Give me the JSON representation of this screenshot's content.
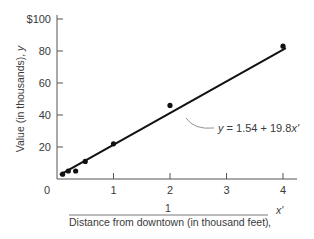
{
  "chart_data": {
    "type": "scatter",
    "title": "",
    "xlabel": "1 / Distance from downtown (in thousand feet), x'",
    "xlabel_numerator": "1",
    "xlabel_denominator": "Distance from downtown (in thousand feet)",
    "xlabel_var": "x'",
    "ylabel": "Value (in thousands), y",
    "ylabel_text": "Value (in thousands), ",
    "ylabel_var": "y",
    "xlim": [
      0,
      4.25
    ],
    "ylim": [
      0,
      100
    ],
    "x_ticks": [
      1,
      2,
      3,
      4
    ],
    "x_tick_labels": [
      "1",
      "2",
      "3",
      "4"
    ],
    "y_ticks": [
      20,
      40,
      60,
      80,
      100
    ],
    "y_tick_labels": [
      "20",
      "40",
      "60",
      "80",
      "$100"
    ],
    "origin_label": "0",
    "grid": false,
    "points": [
      {
        "x": 0.1,
        "y": 3
      },
      {
        "x": 0.2,
        "y": 5
      },
      {
        "x": 0.33,
        "y": 5
      },
      {
        "x": 0.5,
        "y": 11
      },
      {
        "x": 1.0,
        "y": 22
      },
      {
        "x": 2.0,
        "y": 46
      },
      {
        "x": 4.0,
        "y": 83
      }
    ],
    "fit_line": {
      "intercept": 1.54,
      "slope": 19.8,
      "x_range": [
        0.05,
        4.05
      ],
      "label_lhs": "y",
      "label_rhs": " = 1.54 + 19.8",
      "label_var": "x'"
    }
  }
}
